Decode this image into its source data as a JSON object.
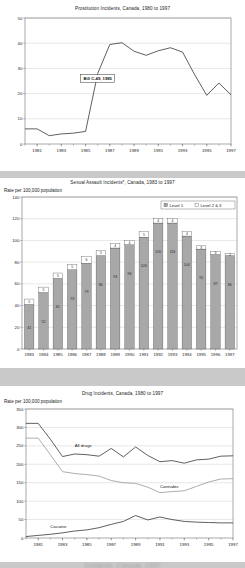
{
  "page": {
    "background_color": "#c9c9c9",
    "panel_color": "#ffffff",
    "footer_text": "Incidents, Canada, 1997"
  },
  "charts": [
    {
      "id": "prostitution",
      "title": "Prostitution Incidents, Canada, 1980 to 1997",
      "ylabel": "",
      "type": "line",
      "grid": true,
      "legend_position": "none",
      "ylim": [
        0,
        50
      ],
      "yticks": [
        0,
        10,
        20,
        30,
        40,
        50
      ],
      "x": [
        1980,
        1981,
        1982,
        1983,
        1984,
        1985,
        1986,
        1987,
        1988,
        1989,
        1990,
        1991,
        1992,
        1993,
        1994,
        1995,
        1996,
        1997
      ],
      "xticks": [
        1981,
        1983,
        1985,
        1987,
        1989,
        1991,
        1993,
        1995,
        1997
      ],
      "series": [
        {
          "name": "Prostitution incidents",
          "values": [
            6.0,
            6.0,
            3.3,
            4.0,
            4.3,
            5.0,
            28.0,
            39.5,
            40.2,
            36.8,
            35.2,
            37.0,
            38.2,
            36.5,
            27.5,
            19.3,
            24.2,
            19.5
          ]
        }
      ],
      "annotation": {
        "label": "Bill C-49, 1985",
        "x": 1986,
        "y": 26
      }
    },
    {
      "id": "sexual-assault",
      "title": "Sexual Assault Incidents*, Canada, 1983 to 1997",
      "ylabel": "Rate per 100,000 population",
      "type": "bar",
      "stacked": true,
      "grid": true,
      "legend_position": "top-right",
      "ylim": [
        0,
        140
      ],
      "yticks": [
        0,
        20,
        40,
        60,
        80,
        100,
        120,
        140
      ],
      "categories": [
        "1983",
        "1984",
        "1985",
        "1986",
        "1987",
        "1988",
        "1989",
        "1990",
        "1991",
        "1992",
        "1993",
        "1994",
        "1995",
        "1996",
        "1997"
      ],
      "series": [
        {
          "name": "Level 1",
          "color": "#a8a8a8",
          "values": [
            41,
            52,
            65,
            73,
            79,
            86,
            93,
            96,
            103,
            116,
            116,
            104,
            92,
            87,
            86
          ]
        },
        {
          "name": "Level 2 & 3",
          "color": "#ffffff",
          "values": [
            5,
            5,
            5,
            5,
            6,
            5,
            4,
            4,
            5,
            4,
            4,
            4,
            3,
            3,
            2
          ]
        }
      ]
    },
    {
      "id": "drug-incidents",
      "title": "Drug Incidents, Canada, 1980 to 1997",
      "ylabel": "Rate per 100,000 population",
      "type": "line",
      "grid": true,
      "legend_position": "inline-labels",
      "ylim": [
        0,
        350
      ],
      "yticks": [
        0,
        50,
        100,
        150,
        200,
        250,
        300,
        350
      ],
      "x": [
        1980,
        1981,
        1982,
        1983,
        1984,
        1985,
        1986,
        1987,
        1988,
        1989,
        1990,
        1991,
        1992,
        1993,
        1994,
        1995,
        1996,
        1997
      ],
      "xticks": [
        1981,
        1983,
        1985,
        1987,
        1989,
        1991,
        1993,
        1995,
        1997
      ],
      "series": [
        {
          "name": "All drugs",
          "style": "dark",
          "label_x": 1984,
          "label_y": 248,
          "values": [
            311,
            311,
            268,
            221,
            228,
            226,
            222,
            243,
            220,
            247,
            224,
            207,
            210,
            203,
            212,
            214,
            222,
            223
          ]
        },
        {
          "name": "Cannabis",
          "style": "light",
          "label_x": 1991,
          "label_y": 136,
          "values": [
            271,
            271,
            226,
            180,
            175,
            172,
            168,
            156,
            150,
            148,
            138,
            123,
            126,
            128,
            140,
            152,
            160,
            161
          ]
        },
        {
          "name": "Cocaine",
          "style": "dark",
          "label_x": 1982,
          "label_y": 28,
          "values": [
            4,
            7,
            10,
            14,
            19,
            22,
            28,
            37,
            45,
            61,
            49,
            57,
            50,
            45,
            43,
            42,
            41,
            41
          ]
        }
      ]
    }
  ]
}
